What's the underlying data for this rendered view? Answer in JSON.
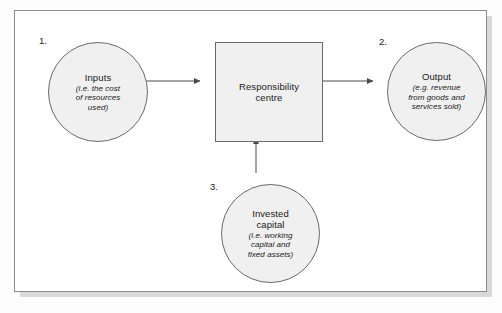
{
  "diagram": {
    "background_color": "#fdfdfd",
    "frame_border_color": "#8c8c8c",
    "shape_fill_color": "#f0f0f0",
    "shape_border_color": "#6a6a6a",
    "arrow_color": "#4a4a4a",
    "nodes": [
      {
        "id": "inputs",
        "callout": "1.",
        "shape": "circle",
        "title": "Inputs",
        "subtitle": "(i.e. the cost\nof resources\nused)"
      },
      {
        "id": "responsibility-centre",
        "callout": "",
        "shape": "rectangle",
        "title": "Responsibility\ncentre",
        "subtitle": ""
      },
      {
        "id": "output",
        "callout": "2.",
        "shape": "circle",
        "title": "Output",
        "subtitle": "(e.g. revenue\nfrom goods and\nservices sold)"
      },
      {
        "id": "invested-capital",
        "callout": "3.",
        "shape": "circle",
        "title": "Invested\ncapital",
        "subtitle": "(i.e. working\ncapital and\nfixed assets)"
      }
    ],
    "arrows": [
      {
        "id": "inputs-to-centre",
        "from": "inputs",
        "to": "responsibility-centre",
        "direction": "right"
      },
      {
        "id": "centre-to-output",
        "from": "responsibility-centre",
        "to": "output",
        "direction": "right"
      },
      {
        "id": "capital-to-centre",
        "from": "invested-capital",
        "to": "responsibility-centre",
        "direction": "up"
      }
    ]
  }
}
